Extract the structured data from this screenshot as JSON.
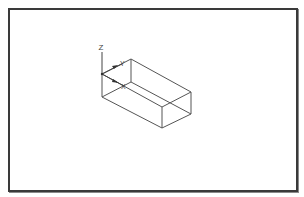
{
  "viewport": {
    "border_color": "#3a3a3a",
    "background": "#ffffff"
  },
  "ucs_icon": {
    "z_label": "Z",
    "y_label": "Y",
    "x_label": "X"
  },
  "model": {
    "type": "wireframe-box",
    "vertices": {
      "top_front_left": [
        102,
        74
      ],
      "top_back_left": [
        131,
        59
      ],
      "top_back_right": [
        191,
        92
      ],
      "top_front_right": [
        162,
        107
      ],
      "bottom_front_left": [
        102,
        97
      ],
      "bottom_back_left": [
        131,
        82
      ],
      "bottom_back_right": [
        191,
        114
      ],
      "bottom_front_right": [
        162,
        128
      ]
    },
    "edge_color": "#555555"
  }
}
